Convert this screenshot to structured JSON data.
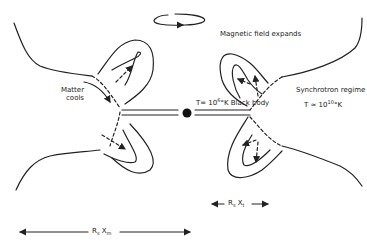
{
  "labels": {
    "magnetic_field": "Magnetic field expands",
    "matter_cools_line1": "Matter",
    "matter_cools_line2": "cools",
    "synchrotron": "Synchrotron regime",
    "synchrotron_temp_prefix": "T ≃ 10",
    "synchrotron_temp_exp": "10",
    "synchrotron_temp_suffix": "°K",
    "blackbody_prefix": "T= 10",
    "blackbody_exp": "6",
    "blackbody_suffix": "°K Black body",
    "scale_inner_R": "R",
    "scale_inner_sub": "s",
    "scale_inner_X": " X",
    "scale_inner_Xsub": "t",
    "scale_outer_R": "R",
    "scale_outer_sub": "s",
    "scale_outer_X": " X",
    "scale_outer_Xsub": "m"
  },
  "colors": {
    "ink": "#222222",
    "background": "#ffffff"
  }
}
